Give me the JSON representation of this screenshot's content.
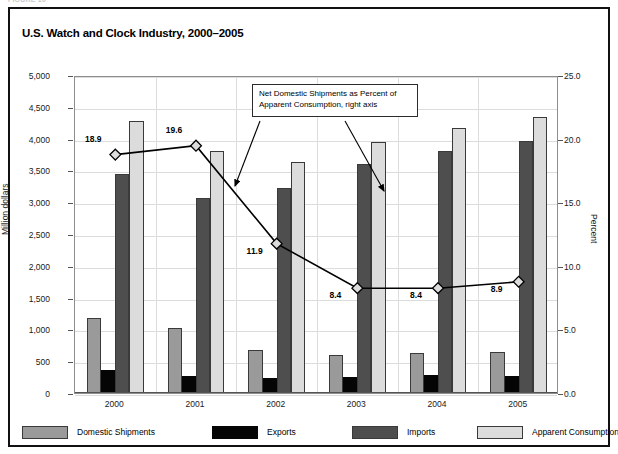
{
  "figure_caption": "FIGURE 10",
  "chart_title": "U.S. Watch and Clock Industry, 2000–2005",
  "annotation": {
    "text": "Net Domestic Shipments as Percent of Apparent Consumption, right axis"
  },
  "legend": {
    "items": [
      {
        "label": "Domestic Shipments",
        "key": "domestic",
        "color": "#9a9a9a"
      },
      {
        "label": "Exports",
        "key": "exports",
        "color": "#050505"
      },
      {
        "label": "Imports",
        "key": "imports",
        "color": "#4e4e4e"
      },
      {
        "label": "Apparent Consumption",
        "key": "apparent",
        "color": "#dcdcdc"
      }
    ]
  },
  "axes": {
    "left_label": "Million dollars",
    "right_label": "Percent",
    "left_ticks": [
      "5,000",
      "4,500",
      "4,000",
      "3,500",
      "3,000",
      "2,500",
      "2,000",
      "1,500",
      "1,000",
      "500",
      "0"
    ],
    "right_ticks": [
      "25.0",
      "20.0",
      "15.0",
      "10.0",
      "5.0",
      "0.0"
    ]
  },
  "chart_data": {
    "type": "bar",
    "title": "U.S. Watch and Clock Industry, 2000–2005",
    "xlabel": "",
    "ylabel": "Million dollars",
    "ylabel2": "Percent",
    "ylim": [
      0,
      5000
    ],
    "ylim2": [
      0,
      25
    ],
    "ytick_step": 500,
    "ytick2_step": 5,
    "grid": true,
    "legend_position": "bottom",
    "categories": [
      "2000",
      "2001",
      "2002",
      "2003",
      "2004",
      "2005"
    ],
    "series": [
      {
        "name": "Domestic Shipments",
        "type": "bar",
        "axis": "left",
        "color": "#9a9a9a",
        "values": [
          1180,
          1020,
          680,
          590,
          625,
          650
        ]
      },
      {
        "name": "Exports",
        "type": "bar",
        "axis": "left",
        "color": "#050505",
        "values": [
          355,
          265,
          235,
          250,
          280,
          265
        ]
      },
      {
        "name": "Imports",
        "type": "bar",
        "axis": "left",
        "color": "#4e4e4e",
        "values": [
          3450,
          3060,
          3220,
          3600,
          3800,
          3960
        ]
      },
      {
        "name": "Apparent Consumption",
        "type": "bar",
        "axis": "left",
        "color": "#dcdcdc",
        "values": [
          4280,
          3800,
          3640,
          3940,
          4160,
          4345
        ]
      },
      {
        "name": "Net Domestic Shipments as Percent of Apparent Consumption",
        "type": "line",
        "axis": "right",
        "color": "#000000",
        "values": [
          18.9,
          19.6,
          11.9,
          8.4,
          8.4,
          8.9
        ],
        "data_labels": [
          "18.9",
          "19.6",
          "11.9",
          "8.4",
          "8.4",
          "8.9"
        ]
      }
    ]
  }
}
